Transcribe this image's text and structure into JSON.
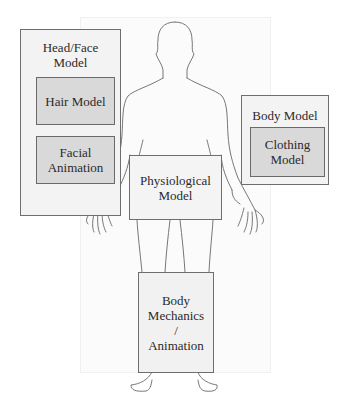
{
  "diagram": {
    "type": "human body model component diagram",
    "figure": "front-facing human body outline",
    "boxes": {
      "head_face": {
        "label": "Head/Face\nModel",
        "children": {
          "hair": {
            "label": "Hair Model"
          },
          "facial": {
            "label": "Facial\nAnimation"
          }
        }
      },
      "body_model": {
        "label": "Body Model",
        "children": {
          "clothing": {
            "label": "Clothing\nModel"
          }
        }
      },
      "physiological": {
        "label": "Physiological\nModel"
      },
      "mechanics": {
        "label": "Body\nMechanics\n/\nAnimation"
      }
    },
    "colors": {
      "outer_box_fill": "#f3f3f3",
      "inner_box_fill": "#d9d9d9",
      "border": "#6e6e6e",
      "outline": "#777777",
      "panel": "#fbfbfb"
    }
  }
}
